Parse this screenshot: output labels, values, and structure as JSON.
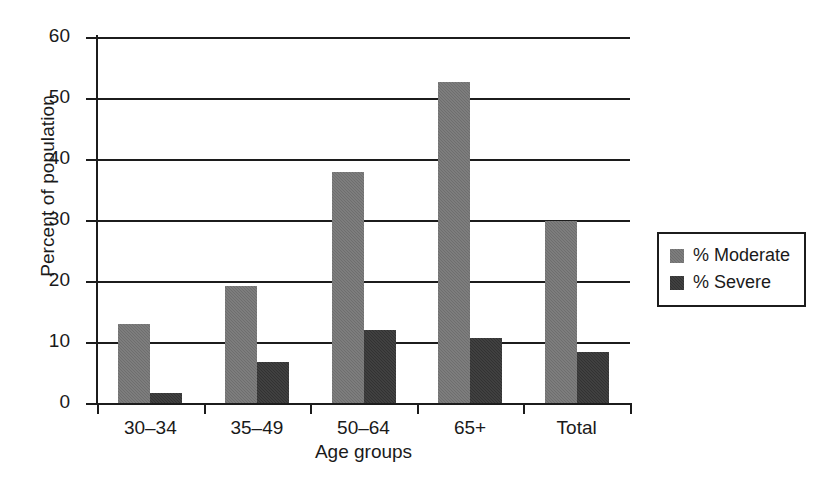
{
  "chart_data": {
    "type": "bar",
    "title": "",
    "xlabel": "Age groups",
    "ylabel": "Percent of population",
    "categories": [
      "30–34",
      "35–49",
      "50–64",
      "65+",
      "Total"
    ],
    "series": [
      {
        "name": "% Moderate",
        "color": "#6e6e6e",
        "values": [
          13.0,
          19.2,
          37.9,
          52.7,
          29.9
        ]
      },
      {
        "name": "% Severe",
        "color": "#323232",
        "values": [
          1.7,
          6.7,
          12.0,
          10.7,
          8.3
        ]
      }
    ],
    "ylim": [
      0,
      60
    ],
    "yticks": [
      0,
      10,
      20,
      30,
      40,
      50,
      60
    ],
    "ytick_labels": [
      "0",
      "10",
      "20",
      "30",
      "40",
      "50",
      "60"
    ],
    "grid": "horizontal",
    "legend_position": "right",
    "legend_entries": [
      "% Moderate",
      "% Severe"
    ]
  }
}
